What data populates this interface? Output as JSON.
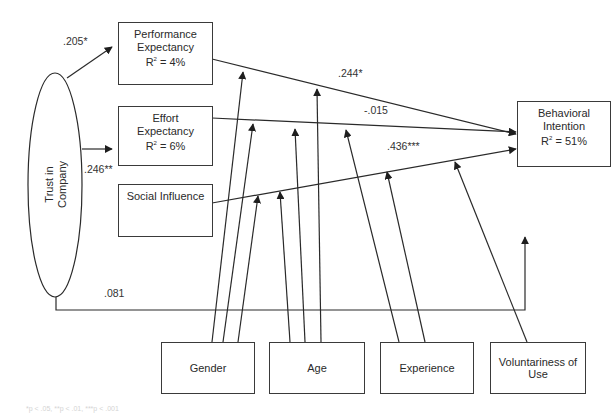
{
  "diagram": {
    "type": "structural-path-model",
    "line_color": "#2a2a2a",
    "nodes": {
      "trust": {
        "line1": "Trust in",
        "line2": "Company",
        "shape": "ellipse"
      },
      "performance": {
        "line1": "Performance",
        "line2": "Expectancy",
        "r2_prefix": "R",
        "r2_sup": "2",
        "r2_value": " = 4%"
      },
      "effort": {
        "line1": "Effort",
        "line2": "Expectancy",
        "r2_prefix": "R",
        "r2_sup": "2",
        "r2_value": " = 6%"
      },
      "social": {
        "line1": "Social Influence"
      },
      "behavioral": {
        "line1": "Behavioral",
        "line2": "Intention",
        "r2_prefix": "R",
        "r2_sup": "2",
        "r2_value": " = 51%"
      },
      "gender": {
        "line1": "Gender"
      },
      "age": {
        "line1": "Age"
      },
      "experience": {
        "line1": "Experience"
      },
      "voluntariness": {
        "line1": "Voluntariness of",
        "line2": "Use"
      }
    },
    "paths": [
      {
        "from": "Trust in Company",
        "to": "Performance Expectancy",
        "coefficient": ".205*"
      },
      {
        "from": "Trust in Company",
        "to": "Effort Expectancy",
        "coefficient": ".246**"
      },
      {
        "from": "Performance Expectancy",
        "to": "Behavioral Intention",
        "coefficient": ".244*"
      },
      {
        "from": "Effort Expectancy",
        "to": "Behavioral Intention",
        "coefficient": "-.015"
      },
      {
        "from": "Social Influence",
        "to": "Behavioral Intention",
        "coefficient": ".436***"
      },
      {
        "from": "Trust in Company",
        "to": "Behavioral Intention",
        "coefficient": ".081"
      }
    ],
    "moderators": {
      "gender": [
        "Performance Expectancy path",
        "Effort Expectancy path",
        "Social Influence path"
      ],
      "age": [
        "Performance Expectancy path",
        "Effort Expectancy path",
        "Social Influence path"
      ],
      "experience": [
        "Effort Expectancy path",
        "Social Influence path"
      ],
      "voluntariness": [
        "Social Influence path"
      ]
    },
    "labels": {
      "trust_perf": ".205*",
      "trust_effort": ".246**",
      "perf_bi": ".244*",
      "effort_bi": "-.015",
      "social_bi": ".436***",
      "trust_bi": ".081"
    },
    "footnote": "*p < .05, **p < .01, ***p < .001"
  }
}
